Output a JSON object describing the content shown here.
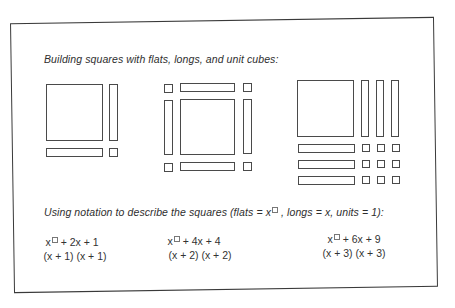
{
  "figure": {
    "title": "Building squares with flats, longs, and unit cubes:",
    "notation_heading_prefix": "Using notation to describe the squares (flats = x",
    "notation_heading_suffix": ", longs = x, units = 1):",
    "squares": [
      {
        "name": "square-1",
        "size": "x+1",
        "flats": 1,
        "longs": 2,
        "units": 1,
        "expanded": {
          "lead": "x",
          "rest": "+ 2x + 1"
        },
        "factored": "(x + 1) (x + 1)"
      },
      {
        "name": "square-2",
        "size": "x+2",
        "flats": 1,
        "longs": 4,
        "units": 4,
        "expanded": {
          "lead": "x",
          "rest": "+ 4x + 4"
        },
        "factored": "(x + 2) (x + 2)"
      },
      {
        "name": "square-3",
        "size": "x+3",
        "flats": 1,
        "longs": 6,
        "units": 9,
        "expanded": {
          "lead": "x",
          "rest": "+ 6x + 9"
        },
        "factored": "(x + 3) (x + 3)"
      }
    ]
  }
}
